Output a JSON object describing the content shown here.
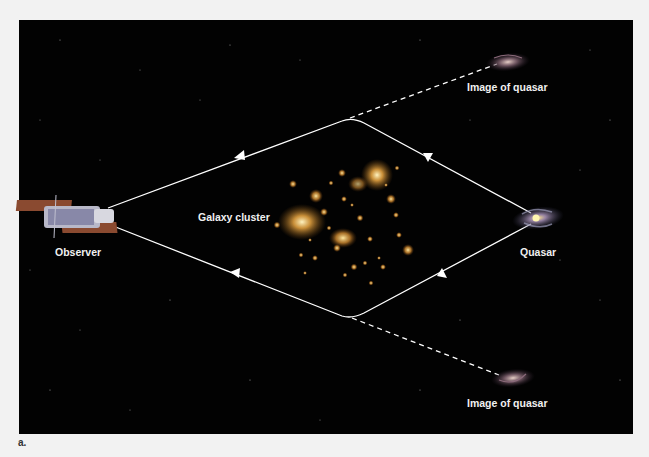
{
  "figure": {
    "panel_letter": "a.",
    "background_color": "#020202",
    "page_color": "#f2f2f2",
    "line_color": "#ffffff"
  },
  "labels": {
    "observer": "Observer",
    "galaxy_cluster": "Galaxy cluster",
    "quasar": "Quasar",
    "image_top": "Image of quasar",
    "image_bottom": "Image of quasar"
  },
  "icons": {
    "observer": "telescope-icon",
    "quasar": "spiral-galaxy-icon",
    "cluster": "galaxy-cluster-icon"
  }
}
